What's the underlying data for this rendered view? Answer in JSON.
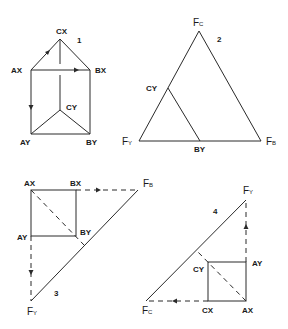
{
  "figures": [
    {
      "number": "1",
      "description": "Triangular prism: top triangle AX-BX-CX, bottom triangle AY-BY-CY",
      "labels": {
        "cx": "CX",
        "ax": "AX",
        "bx": "BX",
        "cy": "CY",
        "ay": "AY",
        "by": "BY"
      }
    },
    {
      "number": "2",
      "description": "Triangle with vertices FC (top), FY (left), FB (right); line from CY to BY",
      "labels": {
        "fc_main": "F",
        "fc_sub": "C",
        "fy_main": "F",
        "fy_sub": "Y",
        "fb_main": "F",
        "fb_sub": "B",
        "cy": "CY",
        "by": "BY"
      }
    },
    {
      "number": "3",
      "description": "Square AX-BX-BY-AY with dashed extensions to FB and FY; hypotenuse FB-FY",
      "labels": {
        "ax": "AX",
        "bx": "BX",
        "ay": "AY",
        "by": "BY",
        "fb_main": "F",
        "fb_sub": "B",
        "fy_main": "F",
        "fy_sub": "Y"
      }
    },
    {
      "number": "4",
      "description": "Square CY-AY-AX-CX with dashed extensions to FY and FC; hypotenuse FC-FY",
      "labels": {
        "fy_main": "F",
        "fy_sub": "Y",
        "ay": "AY",
        "cy": "CY",
        "cx": "CX",
        "ax": "AX",
        "fc_main": "F",
        "fc_sub": "C"
      }
    }
  ]
}
